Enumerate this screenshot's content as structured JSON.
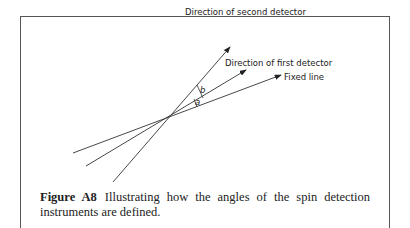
{
  "diagram": {
    "labels": {
      "second": "Direction of second detector",
      "first": "Direction of first detector",
      "fixed": "Fixed line",
      "angle_a": "a",
      "angle_b": "b"
    }
  },
  "caption": {
    "label": "Figure A8",
    "text": "Illustrating how the angles of the spin detection instruments are defined."
  }
}
